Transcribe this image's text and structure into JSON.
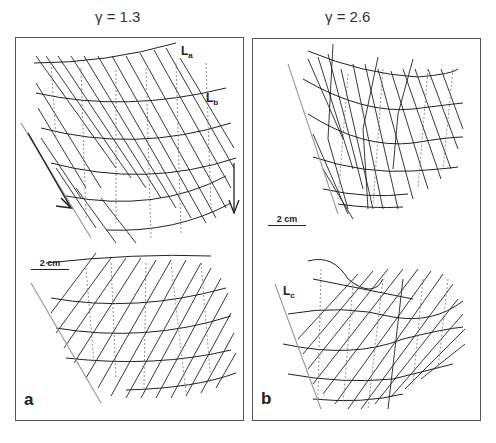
{
  "figure": {
    "panels": [
      {
        "id": "a",
        "label": "a",
        "title": "γ = 1.3",
        "scale_bar": "2 cm",
        "line_labels": [
          {
            "main": "L",
            "sub": "a"
          },
          {
            "main": "L",
            "sub": "b"
          }
        ],
        "arrows": [
          "shear-sense-arrow-diagonal",
          "shear-sense-arrow-down"
        ]
      },
      {
        "id": "b",
        "label": "b",
        "title": "γ = 2.6",
        "scale_bar": "2 cm",
        "line_labels": [
          {
            "main": "L",
            "sub": "c"
          }
        ]
      }
    ],
    "colors": {
      "line": "#222222",
      "dotted": "#777777",
      "reference_line": "#999999",
      "frame": "#555555"
    }
  }
}
